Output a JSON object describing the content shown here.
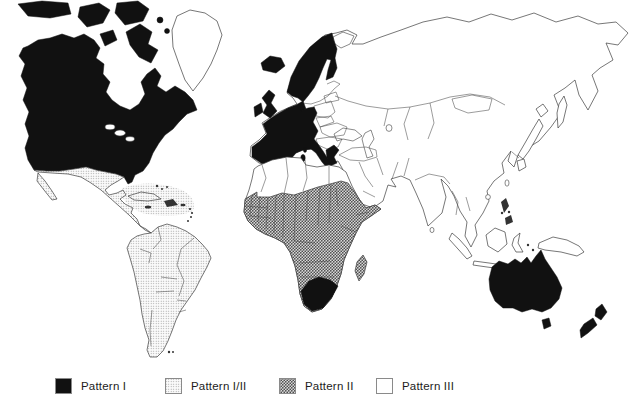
{
  "legend": {
    "items": [
      {
        "label": "Pattern I",
        "pattern": "I"
      },
      {
        "label": "Pattern I/II",
        "pattern": "I_II"
      },
      {
        "label": "Pattern II",
        "pattern": "II"
      },
      {
        "label": "Pattern III",
        "pattern": "III"
      }
    ]
  },
  "patterns": {
    "I": {
      "style": "solid-black",
      "color": "#111111"
    },
    "I_II": {
      "style": "light-stipple",
      "dot_color": "#8a8a8a"
    },
    "II": {
      "style": "dark-stipple",
      "dot_color": "#4a4a4a"
    },
    "III": {
      "style": "white",
      "color": "#ffffff"
    }
  },
  "colors": {
    "background": "#ffffff",
    "outline": "#3c3c3c"
  },
  "map": {
    "regions": {
      "north-america": "I",
      "arctic-islands": "I",
      "greenland": "III",
      "iceland": "I",
      "mexico-central-america": "I_II",
      "caribbean": "I_II",
      "south-america": "I_II",
      "united-kingdom": "I",
      "ireland": "I",
      "scandinavia": "I",
      "denmark": "I",
      "western-europe": "I",
      "italy-islands": "I",
      "greece": "I",
      "eastern-europe": "III",
      "soviet-union-and-asia": "III",
      "kola-peninsula": "III",
      "north-africa-and-whole-africa-underlay": "III",
      "sub-saharan-africa": "II",
      "south-africa": "I",
      "madagascar": "II",
      "japan": "III",
      "southeast-asia-islands": "III",
      "australia": "I",
      "tasmania": "I",
      "new-zealand": "I"
    }
  }
}
